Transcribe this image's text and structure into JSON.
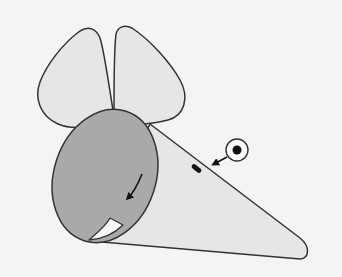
{
  "diagram": {
    "colors": {
      "background": "#f4f4f4",
      "paper_light": "#e6e6e6",
      "paper_dark": "#a9a9a9",
      "flap": "#f7f7f7",
      "outline": "#333333",
      "ink": "#111111"
    },
    "parts": [
      {
        "name": "left-ear",
        "label": "Left ear"
      },
      {
        "name": "right-ear",
        "label": "Right ear"
      },
      {
        "name": "cone-body",
        "label": "Cone body"
      },
      {
        "name": "base-circle",
        "label": "Cone base (back)"
      },
      {
        "name": "curl-flap",
        "label": "Curled flap"
      },
      {
        "name": "turn-arrow",
        "label": "Curved direction arrow"
      },
      {
        "name": "eye-mark",
        "label": "Eye"
      },
      {
        "name": "eye-callout",
        "label": "Eye placement callout"
      }
    ]
  }
}
